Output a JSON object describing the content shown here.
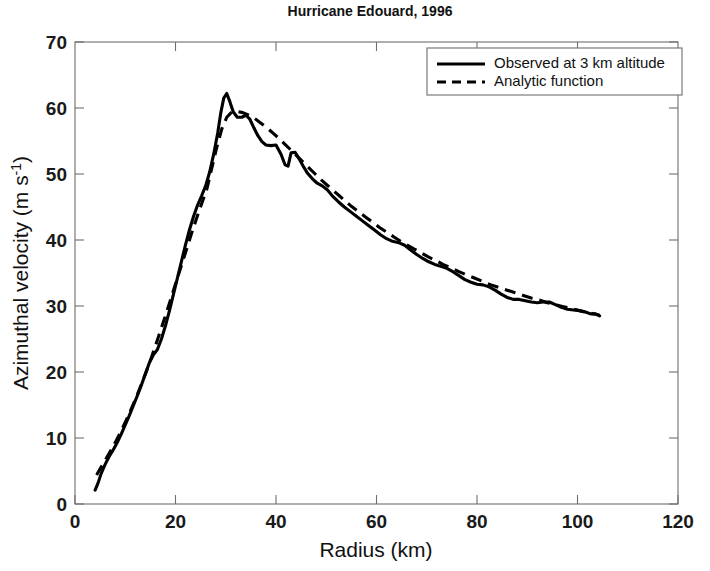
{
  "chart_data": {
    "type": "line",
    "title": "Hurricane Edouard, 1996",
    "xlabel": "Radius (km)",
    "ylabel": "Azimuthal velocity (m s",
    "ylabel_exponent": "-1",
    "ylabel_suffix": ")",
    "xlim": [
      0,
      120
    ],
    "ylim": [
      0,
      70
    ],
    "xticks": [
      0,
      20,
      40,
      60,
      80,
      100,
      120
    ],
    "yticks": [
      0,
      10,
      20,
      30,
      40,
      50,
      60,
      70
    ],
    "grid": false,
    "legend_position": "top-right",
    "legend": [
      {
        "label": "Observed at 3 km altitude",
        "style": "solid"
      },
      {
        "label": "Analytic function",
        "style": "dashed"
      }
    ],
    "series": [
      {
        "name": "Observed at 3 km altitude",
        "style": "solid",
        "color": "#000000",
        "points": [
          [
            4.0,
            2.1
          ],
          [
            4.6,
            3.2
          ],
          [
            5.2,
            4.6
          ],
          [
            6.0,
            6.0
          ],
          [
            6.8,
            7.2
          ],
          [
            7.6,
            8.2
          ],
          [
            8.4,
            9.3
          ],
          [
            9.2,
            10.6
          ],
          [
            10.0,
            12.0
          ],
          [
            10.8,
            13.4
          ],
          [
            11.6,
            14.9
          ],
          [
            12.4,
            16.4
          ],
          [
            13.2,
            18.0
          ],
          [
            14.0,
            19.7
          ],
          [
            14.8,
            21.4
          ],
          [
            15.6,
            22.6
          ],
          [
            16.4,
            23.4
          ],
          [
            17.2,
            25.0
          ],
          [
            18.0,
            27.0
          ],
          [
            18.8,
            29.3
          ],
          [
            19.6,
            31.8
          ],
          [
            20.4,
            34.3
          ],
          [
            21.2,
            36.8
          ],
          [
            22.0,
            39.3
          ],
          [
            22.8,
            41.6
          ],
          [
            23.6,
            43.6
          ],
          [
            24.4,
            45.3
          ],
          [
            25.2,
            46.7
          ],
          [
            26.0,
            48.2
          ],
          [
            26.8,
            50.3
          ],
          [
            27.6,
            53.0
          ],
          [
            28.4,
            56.2
          ],
          [
            29.0,
            59.2
          ],
          [
            29.6,
            61.5
          ],
          [
            30.2,
            62.2
          ],
          [
            30.8,
            61.0
          ],
          [
            31.5,
            59.4
          ],
          [
            32.3,
            58.6
          ],
          [
            33.2,
            58.6
          ],
          [
            34.0,
            58.9
          ],
          [
            34.8,
            58.3
          ],
          [
            35.6,
            57.0
          ],
          [
            36.4,
            55.8
          ],
          [
            37.2,
            54.9
          ],
          [
            38.0,
            54.4
          ],
          [
            39.0,
            54.3
          ],
          [
            40.0,
            54.4
          ],
          [
            41.0,
            53.0
          ],
          [
            41.8,
            51.4
          ],
          [
            42.4,
            51.2
          ],
          [
            43.0,
            53.2
          ],
          [
            43.8,
            53.3
          ],
          [
            44.6,
            52.3
          ],
          [
            45.4,
            51.2
          ],
          [
            46.2,
            50.2
          ],
          [
            47.2,
            49.3
          ],
          [
            48.2,
            48.6
          ],
          [
            49.2,
            48.2
          ],
          [
            50.2,
            47.6
          ],
          [
            51.2,
            46.7
          ],
          [
            52.4,
            45.8
          ],
          [
            53.6,
            45.0
          ],
          [
            54.8,
            44.3
          ],
          [
            56.0,
            43.6
          ],
          [
            57.2,
            42.9
          ],
          [
            58.4,
            42.2
          ],
          [
            59.6,
            41.5
          ],
          [
            60.8,
            40.8
          ],
          [
            62.0,
            40.2
          ],
          [
            63.2,
            39.8
          ],
          [
            64.4,
            39.6
          ],
          [
            65.6,
            39.2
          ],
          [
            66.8,
            38.5
          ],
          [
            68.0,
            37.8
          ],
          [
            69.2,
            37.2
          ],
          [
            70.4,
            36.7
          ],
          [
            71.6,
            36.3
          ],
          [
            72.8,
            36.0
          ],
          [
            74.0,
            35.7
          ],
          [
            75.2,
            35.2
          ],
          [
            76.4,
            34.6
          ],
          [
            77.6,
            34.0
          ],
          [
            78.8,
            33.6
          ],
          [
            80.0,
            33.3
          ],
          [
            81.2,
            33.2
          ],
          [
            82.4,
            32.9
          ],
          [
            83.6,
            32.4
          ],
          [
            84.8,
            31.8
          ],
          [
            86.0,
            31.3
          ],
          [
            87.2,
            31.0
          ],
          [
            88.4,
            31.0
          ],
          [
            89.6,
            30.8
          ],
          [
            90.8,
            30.6
          ],
          [
            92.0,
            30.5
          ],
          [
            93.2,
            30.6
          ],
          [
            94.4,
            30.6
          ],
          [
            95.6,
            30.2
          ],
          [
            96.8,
            29.8
          ],
          [
            98.0,
            29.5
          ],
          [
            99.2,
            29.4
          ],
          [
            100.4,
            29.3
          ],
          [
            101.6,
            29.1
          ],
          [
            102.6,
            28.8
          ],
          [
            103.6,
            28.8
          ],
          [
            104.4,
            28.5
          ]
        ]
      },
      {
        "name": "Analytic function",
        "style": "dashed",
        "color": "#000000",
        "points": [
          [
            4.3,
            4.4
          ],
          [
            5.2,
            5.6
          ],
          [
            6.2,
            6.9
          ],
          [
            7.2,
            8.2
          ],
          [
            8.2,
            9.6
          ],
          [
            9.2,
            11.1
          ],
          [
            10.2,
            12.7
          ],
          [
            11.2,
            14.4
          ],
          [
            12.2,
            16.2
          ],
          [
            13.2,
            18.1
          ],
          [
            14.2,
            20.1
          ],
          [
            15.2,
            22.2
          ],
          [
            16.2,
            24.4
          ],
          [
            17.2,
            26.7
          ],
          [
            18.2,
            29.0
          ],
          [
            19.2,
            31.4
          ],
          [
            20.2,
            33.8
          ],
          [
            21.2,
            36.2
          ],
          [
            22.2,
            38.6
          ],
          [
            23.2,
            41.0
          ],
          [
            24.2,
            43.3
          ],
          [
            25.2,
            45.5
          ],
          [
            26.2,
            47.6
          ],
          [
            27.2,
            50.8
          ],
          [
            28.2,
            54.0
          ],
          [
            29.2,
            56.8
          ],
          [
            30.2,
            58.6
          ],
          [
            31.2,
            59.4
          ],
          [
            32.2,
            59.5
          ],
          [
            33.4,
            59.3
          ],
          [
            34.6,
            58.9
          ],
          [
            35.8,
            58.4
          ],
          [
            37.0,
            57.7
          ],
          [
            38.2,
            57.0
          ],
          [
            39.4,
            56.2
          ],
          [
            40.6,
            55.4
          ],
          [
            41.8,
            54.5
          ],
          [
            43.0,
            53.6
          ],
          [
            44.2,
            52.7
          ],
          [
            45.4,
            51.8
          ],
          [
            46.6,
            50.9
          ],
          [
            47.8,
            50.0
          ],
          [
            49.0,
            49.1
          ],
          [
            50.2,
            48.3
          ],
          [
            51.4,
            47.5
          ],
          [
            52.6,
            46.7
          ],
          [
            53.8,
            45.9
          ],
          [
            55.0,
            45.1
          ],
          [
            56.4,
            44.3
          ],
          [
            57.8,
            43.5
          ],
          [
            59.2,
            42.7
          ],
          [
            60.6,
            41.9
          ],
          [
            62.0,
            41.2
          ],
          [
            63.4,
            40.5
          ],
          [
            64.8,
            39.8
          ],
          [
            66.2,
            39.2
          ],
          [
            67.6,
            38.6
          ],
          [
            69.0,
            38.0
          ],
          [
            70.4,
            37.4
          ],
          [
            71.8,
            36.9
          ],
          [
            73.2,
            36.3
          ],
          [
            74.8,
            35.8
          ],
          [
            76.4,
            35.2
          ],
          [
            78.0,
            34.7
          ],
          [
            79.6,
            34.2
          ],
          [
            81.2,
            33.7
          ],
          [
            82.8,
            33.2
          ],
          [
            84.4,
            32.8
          ],
          [
            86.0,
            32.4
          ],
          [
            87.6,
            32.0
          ],
          [
            89.2,
            31.6
          ],
          [
            90.8,
            31.2
          ],
          [
            92.4,
            30.9
          ],
          [
            94.0,
            30.5
          ],
          [
            95.6,
            30.2
          ],
          [
            97.2,
            29.9
          ],
          [
            98.8,
            29.6
          ],
          [
            100.4,
            29.3
          ],
          [
            102.0,
            29.0
          ],
          [
            103.4,
            28.8
          ],
          [
            104.4,
            28.6
          ]
        ]
      }
    ]
  },
  "plot_geometry": {
    "left": 75,
    "right": 678,
    "top": 42,
    "bottom": 504
  }
}
